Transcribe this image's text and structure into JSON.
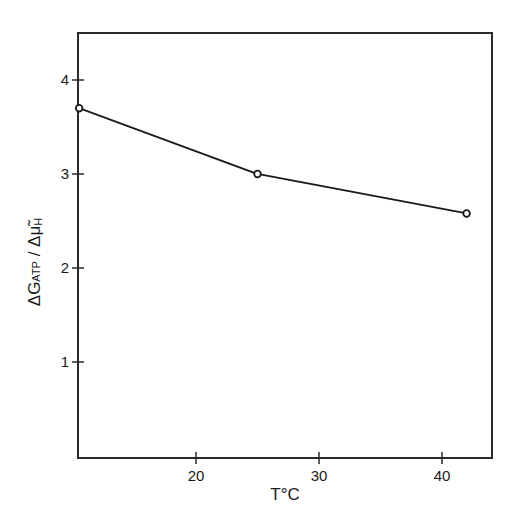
{
  "chart_data": {
    "type": "line",
    "title": "",
    "xlabel": "T°C",
    "ylabel": "ΔG ATP / Δμ̃H",
    "ylabel_parts": {
      "main": "ΔG",
      "sub": "ATP",
      "slash": " / ",
      "den": "Δμ̃",
      "den_sub": "H"
    },
    "x": [
      10.5,
      25,
      42
    ],
    "series": [
      {
        "name": "ΔG_ATP/Δμ̃H",
        "values": [
          3.7,
          3.0,
          2.58
        ],
        "marker": "open-circle"
      }
    ],
    "xlim": [
      10,
      44
    ],
    "ylim": [
      0,
      4.5
    ],
    "xticks": [
      20,
      30,
      40
    ],
    "yticks": [
      1,
      2,
      3,
      4
    ],
    "xtick_labels": [
      "20",
      "30",
      "40"
    ],
    "ytick_labels": [
      "1",
      "2",
      "3",
      "4"
    ],
    "grid": false,
    "legend": null,
    "frame": "box"
  },
  "colors": {
    "line": "#1a1a1a",
    "background": "#ffffff"
  }
}
